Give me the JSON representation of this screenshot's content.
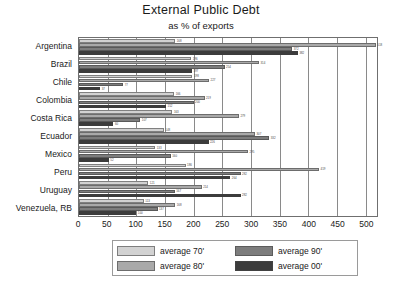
{
  "chart_data": {
    "type": "bar",
    "orientation": "horizontal",
    "title": "External Public Debt",
    "subtitle": "as % of exports",
    "xlabel": "",
    "ylabel": "",
    "xlim": [
      0,
      520
    ],
    "xticks": [
      0,
      50,
      100,
      150,
      200,
      250,
      300,
      350,
      400,
      450,
      500
    ],
    "grid": true,
    "legend_position": "bottom",
    "categories": [
      "Argentina",
      "Brazil",
      "Chile",
      "Colombia",
      "Costa Rica",
      "Ecuador",
      "Mexico",
      "Peru",
      "Uruguay",
      "Venezuela, RB"
    ],
    "series": [
      {
        "name": "average 70'",
        "color": "#d2d2d2",
        "values": [
          168,
          196,
          198,
          166,
          163,
          148,
          133,
          186,
          121,
          113
        ]
      },
      {
        "name": "average 80'",
        "color": "#a9a9a9",
        "values": [
          518,
          314,
          227,
          219,
          279,
          307,
          295,
          419,
          214,
          168
        ]
      },
      {
        "name": "average 90'",
        "color": "#7d7d7d",
        "values": [
          372,
          254,
          77,
          200,
          107,
          332,
          160,
          282,
          167,
          137
        ]
      },
      {
        "name": "average 00'",
        "color": "#3c3c3c",
        "values": [
          382,
          197,
          37,
          152,
          60,
          226,
          52,
          264,
          282,
          100
        ]
      }
    ]
  },
  "legend": {
    "items": [
      {
        "label": "average 70'",
        "series": 0
      },
      {
        "label": "average 80'",
        "series": 1
      },
      {
        "label": "average 90'",
        "series": 2
      },
      {
        "label": "average 00'",
        "series": 3
      }
    ]
  }
}
